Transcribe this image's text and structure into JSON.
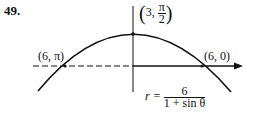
{
  "problem_number": "49.",
  "points": {
    "top": {
      "r": "3",
      "theta": "π",
      "theta_den": "2"
    },
    "left": "(6, π)",
    "right": "(6, 0)"
  },
  "equation": {
    "lhs": "r =",
    "numerator": "6",
    "denominator": "1 + sin θ"
  }
}
